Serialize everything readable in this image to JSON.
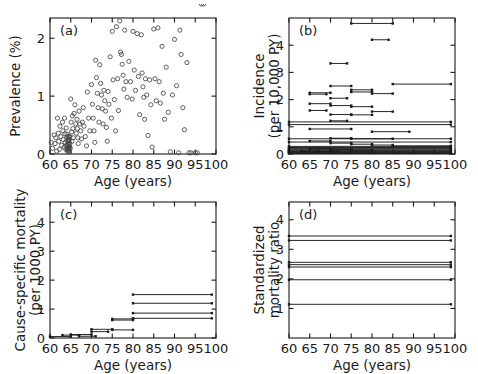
{
  "figure": {
    "width": 478,
    "height": 374,
    "background": "#ffffff",
    "ink": "#1a1a1a",
    "panel_count": 4
  },
  "chart_data": [
    {
      "type": "scatter",
      "panel": "a",
      "panel_label": "(a)",
      "title": "",
      "xlabel": "Age (years)",
      "ylabel": "Prevalence (%)",
      "xlim": [
        60,
        100
      ],
      "ylim": [
        0,
        2.35
      ],
      "xticks": [
        60,
        65,
        70,
        75,
        80,
        85,
        90,
        95,
        100
      ],
      "yticks": [
        0,
        1,
        2
      ],
      "grid": false,
      "legend": "none",
      "marker": "open-circle",
      "marker_color": "#444444",
      "x": [
        60.3,
        60.6,
        61.0,
        61.2,
        61.4,
        61.6,
        61.8,
        62.0,
        62.1,
        62.3,
        62.4,
        62.6,
        62.8,
        63.0,
        63.1,
        63.2,
        63.4,
        63.5,
        63.6,
        63.7,
        63.8,
        63.9,
        64.0,
        64.0,
        64.1,
        64.1,
        64.2,
        64.2,
        64.3,
        64.3,
        64.3,
        64.4,
        64.4,
        64.4,
        64.5,
        64.5,
        64.5,
        64.5,
        64.6,
        64.6,
        64.6,
        64.7,
        64.7,
        64.8,
        64.8,
        64.9,
        65.0,
        65.1,
        65.2,
        65.3,
        65.4,
        65.5,
        65.6,
        65.8,
        66.0,
        66.2,
        66.3,
        66.5,
        66.6,
        66.7,
        66.8,
        67.0,
        67.2,
        67.4,
        67.6,
        67.8,
        68.0,
        68.2,
        68.5,
        68.8,
        69.0,
        69.3,
        69.6,
        70.0,
        70.2,
        70.4,
        70.6,
        70.8,
        71.0,
        71.2,
        71.4,
        71.6,
        71.8,
        72.0,
        72.2,
        72.4,
        72.6,
        72.8,
        73.0,
        73.2,
        73.4,
        73.6,
        73.8,
        74.0,
        74.2,
        74.5,
        74.8,
        75.0,
        75.2,
        75.5,
        75.8,
        76.0,
        76.3,
        76.5,
        76.8,
        77.0,
        77.2,
        77.4,
        77.6,
        77.8,
        78.0,
        78.3,
        78.6,
        79.0,
        79.4,
        79.8,
        80.0,
        80.3,
        80.6,
        81.0,
        81.3,
        81.6,
        82.0,
        82.2,
        82.4,
        82.6,
        82.8,
        83.0,
        83.3,
        83.6,
        84.0,
        84.3,
        84.6,
        85.0,
        85.3,
        85.6,
        86.0,
        86.3,
        86.6,
        87.0,
        87.3,
        87.6,
        88.0,
        88.5,
        89.0,
        89.5,
        90.0,
        90.5,
        91.0,
        91.3,
        91.6,
        92.0,
        92.4,
        93.0,
        93.5,
        94.0,
        95.0,
        95.5,
        96.5,
        97.0
      ],
      "y": [
        0.2,
        0.1,
        0.33,
        0.18,
        0.28,
        0.05,
        0.62,
        0.36,
        0.22,
        0.08,
        0.48,
        0.3,
        0.15,
        0.55,
        0.4,
        0.25,
        0.12,
        0.62,
        0.35,
        0.2,
        0.08,
        0.45,
        0.28,
        0.15,
        0.34,
        0.1,
        0.22,
        0.05,
        0.3,
        0.14,
        0.08,
        0.26,
        0.18,
        0.1,
        0.22,
        0.12,
        0.05,
        0.3,
        0.16,
        0.08,
        0.24,
        0.12,
        0.04,
        0.18,
        0.3,
        0.1,
        0.95,
        0.55,
        0.38,
        0.22,
        0.66,
        0.44,
        0.28,
        0.7,
        0.85,
        0.52,
        0.36,
        0.6,
        0.44,
        0.28,
        0.18,
        0.74,
        0.52,
        0.4,
        0.26,
        0.55,
        0.8,
        0.48,
        0.3,
        0.14,
        1.07,
        0.62,
        0.4,
        1.2,
        0.86,
        0.62,
        0.4,
        0.2,
        1.62,
        1.32,
        1.05,
        0.8,
        0.55,
        1.54,
        1.22,
        1.02,
        0.78,
        0.52,
        1.1,
        0.92,
        0.74,
        0.46,
        0.22,
        1.08,
        0.86,
        1.68,
        0.62,
        2.12,
        1.28,
        0.94,
        0.4,
        2.2,
        1.3,
        0.75,
        2.3,
        1.76,
        1.72,
        1.55,
        1.36,
        1.12,
        2.14,
        1.25,
        0.98,
        1.6,
        1.25,
        0.95,
        2.12,
        1.45,
        1.1,
        2.08,
        1.34,
        0.68,
        2.06,
        1.4,
        1.16,
        0.98,
        0.6,
        1.3,
        1.02,
        0.32,
        1.28,
        0.85,
        0.12,
        2.16,
        1.3,
        0.92,
        2.18,
        1.25,
        0.88,
        1.86,
        1.05,
        0.6,
        1.5,
        0.72,
        0.04,
        1.02,
        1.98,
        1.18,
        0.02,
        2.14,
        1.72,
        0.8,
        0.42,
        1.58,
        0.02,
        0.02,
        0.02,
        0.02
      ]
    },
    {
      "type": "segments",
      "panel": "b",
      "panel_label": "(b)",
      "title": "",
      "xlabel": "Age (years)",
      "ylabel": "Incidence (per 10,000 PY)",
      "ylabel_line1": "Incidence",
      "ylabel_line2": "(per 10,000 PY)",
      "xlim": [
        60,
        100
      ],
      "ylim": [
        0,
        5.0
      ],
      "xticks": [
        60,
        65,
        70,
        75,
        80,
        85,
        90,
        95,
        100
      ],
      "yticks": [
        0,
        1,
        2,
        3,
        4
      ],
      "grid": false,
      "legend": "none",
      "marker": "square-endpoints",
      "segments": [
        {
          "x0": 75.0,
          "x1": 85.0,
          "y": 4.8
        },
        {
          "x0": 80.0,
          "x1": 84.0,
          "y": 4.2
        },
        {
          "x0": 70.0,
          "x1": 74.0,
          "y": 3.33
        },
        {
          "x0": 85.0,
          "x1": 99.0,
          "y": 2.57
        },
        {
          "x0": 70.0,
          "x1": 75.0,
          "y": 2.5
        },
        {
          "x0": 75.0,
          "x1": 80.0,
          "y": 2.36
        },
        {
          "x0": 75.0,
          "x1": 80.0,
          "y": 2.28
        },
        {
          "x0": 65.0,
          "x1": 70.0,
          "y": 2.25
        },
        {
          "x0": 65.0,
          "x1": 69.0,
          "y": 2.2
        },
        {
          "x0": 80.0,
          "x1": 85.0,
          "y": 2.22
        },
        {
          "x0": 70.0,
          "x1": 74.0,
          "y": 2.05
        },
        {
          "x0": 65.0,
          "x1": 70.0,
          "y": 1.85
        },
        {
          "x0": 70.0,
          "x1": 75.0,
          "y": 1.78
        },
        {
          "x0": 75.0,
          "x1": 80.0,
          "y": 1.74
        },
        {
          "x0": 65.0,
          "x1": 69.0,
          "y": 1.6
        },
        {
          "x0": 80.0,
          "x1": 85.0,
          "y": 1.56
        },
        {
          "x0": 70.0,
          "x1": 75.0,
          "y": 1.45
        },
        {
          "x0": 75.0,
          "x1": 80.0,
          "y": 1.44
        },
        {
          "x0": 70.0,
          "x1": 74.0,
          "y": 1.22
        },
        {
          "x0": 60.0,
          "x1": 99.0,
          "y": 1.18
        },
        {
          "x0": 60.0,
          "x1": 99.0,
          "y": 1.08
        },
        {
          "x0": 65.0,
          "x1": 75.0,
          "y": 0.92
        },
        {
          "x0": 80.0,
          "x1": 89.0,
          "y": 0.82
        },
        {
          "x0": 60.0,
          "x1": 99.0,
          "y": 0.56
        },
        {
          "x0": 70.0,
          "x1": 75.0,
          "y": 0.58
        },
        {
          "x0": 75.0,
          "x1": 85.0,
          "y": 0.56
        },
        {
          "x0": 65.0,
          "x1": 70.0,
          "y": 0.48
        },
        {
          "x0": 60.0,
          "x1": 99.0,
          "y": 0.44
        },
        {
          "x0": 70.0,
          "x1": 75.0,
          "y": 0.4
        },
        {
          "x0": 75.0,
          "x1": 80.0,
          "y": 0.36
        },
        {
          "x0": 80.0,
          "x1": 85.0,
          "y": 0.33
        },
        {
          "x0": 85.0,
          "x1": 99.0,
          "y": 0.3
        },
        {
          "x0": 60.0,
          "x1": 99.0,
          "y": 0.28
        },
        {
          "x0": 60.0,
          "x1": 99.0,
          "y": 0.24
        },
        {
          "x0": 60.0,
          "x1": 99.0,
          "y": 0.21
        },
        {
          "x0": 60.0,
          "x1": 99.0,
          "y": 0.18
        },
        {
          "x0": 60.0,
          "x1": 99.0,
          "y": 0.15
        },
        {
          "x0": 60.0,
          "x1": 99.0,
          "y": 0.12
        },
        {
          "x0": 60.0,
          "x1": 99.0,
          "y": 0.1
        },
        {
          "x0": 60.0,
          "x1": 99.0,
          "y": 0.08
        },
        {
          "x0": 60.0,
          "x1": 99.0,
          "y": 0.06
        },
        {
          "x0": 60.0,
          "x1": 99.0,
          "y": 0.04
        },
        {
          "x0": 60.0,
          "x1": 99.0,
          "y": 0.02
        },
        {
          "x0": 65.0,
          "x1": 70.0,
          "y": 0.19
        },
        {
          "x0": 70.0,
          "x1": 75.0,
          "y": 0.17
        },
        {
          "x0": 75.0,
          "x1": 80.0,
          "y": 0.14
        },
        {
          "x0": 63.0,
          "x1": 67.0,
          "y": 0.11
        },
        {
          "x0": 67.0,
          "x1": 72.0,
          "y": 0.09
        }
      ]
    },
    {
      "type": "segments",
      "panel": "c",
      "panel_label": "(c)",
      "title": "",
      "xlabel": "Age (years)",
      "ylabel": "Cause-specific mortality (per 1000 PY)",
      "ylabel_line1": "Cause-specific mortality",
      "ylabel_line2": "(per 1000 PY)",
      "xlim": [
        60,
        100
      ],
      "ylim": [
        0,
        4.7
      ],
      "xticks": [
        60,
        65,
        70,
        75,
        80,
        85,
        90,
        95,
        100
      ],
      "yticks": [
        0,
        1,
        2,
        3,
        4
      ],
      "grid": false,
      "legend": "none",
      "marker": "square-endpoints",
      "segments": [
        {
          "x0": 80.0,
          "x1": 99.0,
          "y": 1.5
        },
        {
          "x0": 80.0,
          "x1": 99.0,
          "y": 1.2
        },
        {
          "x0": 80.0,
          "x1": 99.0,
          "y": 0.86
        },
        {
          "x0": 80.0,
          "x1": 99.0,
          "y": 0.68
        },
        {
          "x0": 75.0,
          "x1": 80.0,
          "y": 0.66
        },
        {
          "x0": 75.0,
          "x1": 80.0,
          "y": 0.62
        },
        {
          "x0": 70.0,
          "x1": 75.0,
          "y": 0.3
        },
        {
          "x0": 75.0,
          "x1": 80.0,
          "y": 0.28
        },
        {
          "x0": 70.0,
          "x1": 74.0,
          "y": 0.22
        },
        {
          "x0": 65.0,
          "x1": 70.0,
          "y": 0.12
        },
        {
          "x0": 63.0,
          "x1": 67.0,
          "y": 0.1
        },
        {
          "x0": 60.0,
          "x1": 65.0,
          "y": 0.05
        },
        {
          "x0": 67.0,
          "x1": 71.0,
          "y": 0.06
        }
      ]
    },
    {
      "type": "segments",
      "panel": "d",
      "panel_label": "(d)",
      "title": "",
      "xlabel": "Age (years)",
      "ylabel": "Standardized mortality ratio",
      "ylabel_line1": "Standardized",
      "ylabel_line2": "mortality ratio",
      "xlim": [
        60,
        100
      ],
      "ylim": [
        0,
        4.6
      ],
      "xticks": [
        60,
        65,
        70,
        75,
        80,
        85,
        90,
        95,
        100
      ],
      "yticks": [
        1,
        2,
        3,
        4
      ],
      "grid": false,
      "legend": "none",
      "marker": "square-endpoints",
      "segments": [
        {
          "x0": 60.0,
          "x1": 99.0,
          "y": 3.45
        },
        {
          "x0": 60.0,
          "x1": 99.0,
          "y": 3.3
        },
        {
          "x0": 60.0,
          "x1": 99.0,
          "y": 2.56
        },
        {
          "x0": 60.0,
          "x1": 99.0,
          "y": 2.48
        },
        {
          "x0": 60.0,
          "x1": 99.0,
          "y": 2.4
        },
        {
          "x0": 60.0,
          "x1": 99.0,
          "y": 1.97
        },
        {
          "x0": 60.0,
          "x1": 99.0,
          "y": 1.14
        }
      ]
    }
  ]
}
